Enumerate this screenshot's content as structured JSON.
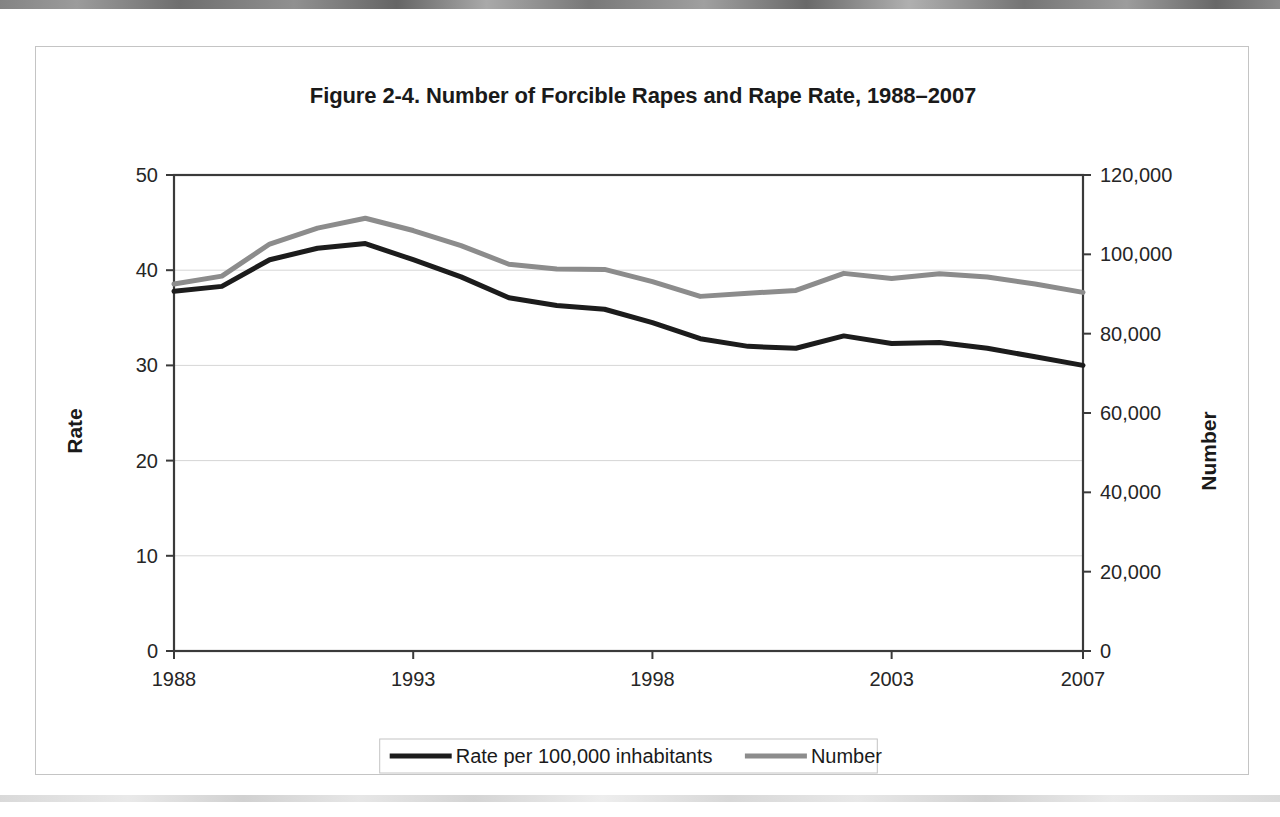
{
  "figure": {
    "title": "Figure 2-4. Number of Forcible Rapes and Rape Rate, 1988–2007"
  },
  "axes": {
    "left_title": "Rate",
    "right_title": "Number",
    "left_ticks": [
      "0",
      "10",
      "20",
      "30",
      "40",
      "50"
    ],
    "right_ticks": [
      "0",
      "20,000",
      "40,000",
      "60,000",
      "80,000",
      "100,000",
      "120,000"
    ],
    "x_ticks": [
      "1988",
      "1993",
      "1998",
      "2003",
      "2007"
    ]
  },
  "legend": {
    "items": [
      {
        "label": "Rate per 100,000 inhabitants",
        "color": "#1c1c1c",
        "width": 5
      },
      {
        "label": "Number",
        "color": "#8c8c8c",
        "width": 5
      }
    ]
  },
  "colors": {
    "rate_line": "#1c1c1c",
    "number_line": "#8c8c8c",
    "axis": "#3a3a3a",
    "gridline": "#d6d6d6",
    "frame": "#c4c4c4",
    "text": "#1a1a1a"
  },
  "chart_data": {
    "type": "line",
    "title": "Figure 2-4. Number of Forcible Rapes and Rape Rate, 1988–2007",
    "xlabel": "",
    "ylabel": "Rate",
    "y2label": "Number",
    "grid": true,
    "legend_position": "bottom",
    "x": [
      1988,
      1989,
      1990,
      1991,
      1992,
      1993,
      1994,
      1995,
      1996,
      1997,
      1998,
      1999,
      2000,
      2001,
      2002,
      2003,
      2004,
      2005,
      2006,
      2007
    ],
    "xlim": [
      1988,
      2007
    ],
    "x_tick_values": [
      1988,
      1993,
      1998,
      2003,
      2007
    ],
    "series": [
      {
        "name": "Rate per 100,000 inhabitants",
        "axis": "left",
        "color": "#1c1c1c",
        "ylim": [
          0,
          50
        ],
        "y_tick_values": [
          0,
          10,
          20,
          30,
          40,
          50
        ],
        "values": [
          37.8,
          38.3,
          41.1,
          42.3,
          42.8,
          41.1,
          39.3,
          37.1,
          36.3,
          35.9,
          34.5,
          32.8,
          32.0,
          31.8,
          33.1,
          32.3,
          32.4,
          31.8,
          30.9,
          30.0
        ]
      },
      {
        "name": "Number",
        "axis": "right",
        "color": "#8c8c8c",
        "ylim": [
          0,
          120000
        ],
        "y_tick_values": [
          0,
          20000,
          40000,
          60000,
          80000,
          100000,
          120000
        ],
        "values": [
          92500,
          94500,
          102600,
          106600,
          109100,
          106000,
          102200,
          97500,
          96300,
          96200,
          93100,
          89400,
          90200,
          90900,
          95200,
          93900,
          95100,
          94300,
          92500,
          90400
        ]
      }
    ]
  }
}
